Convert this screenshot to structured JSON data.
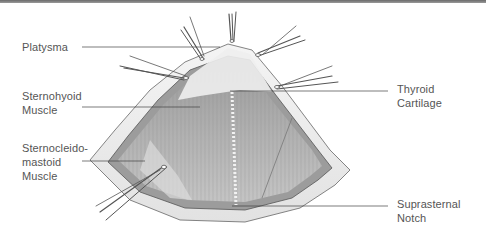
{
  "figure": {
    "labels": [
      {
        "id": "platysma",
        "text": "Platysma",
        "side": "left"
      },
      {
        "id": "sternohyoid",
        "text": "Sternohyoid\nMuscle",
        "side": "left"
      },
      {
        "id": "sternocleidomastoid",
        "text": "Sternocleido-\nmastoid\nMuscle",
        "side": "left"
      },
      {
        "id": "thyroid-cartilage",
        "text": "Thyroid\nCartilage",
        "side": "right"
      },
      {
        "id": "suprasternal-notch",
        "text": "Suprasternal\nNotch",
        "side": "right"
      }
    ]
  },
  "colors": {
    "rule": "#777777",
    "label_text": "#555555",
    "leader_line": "#444444",
    "muscle_dark": "#8a8a8a",
    "muscle_mid": "#a8a8a8",
    "skin_edge": "#d8d8d8"
  }
}
